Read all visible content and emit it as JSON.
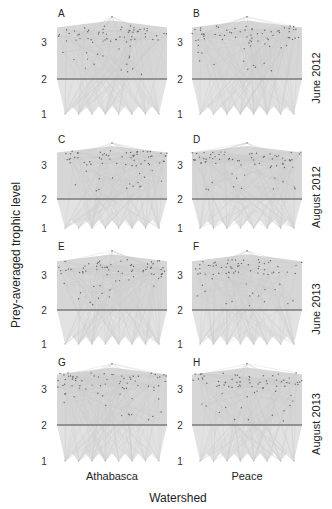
{
  "chart_data": {
    "type": "network-grid",
    "title": "",
    "xlabel": "Watershed",
    "ylabel": "Prey-averaged trophic level",
    "columns": [
      "Athabasca",
      "Peace"
    ],
    "rows": [
      "June 2012",
      "August 2012",
      "June 2013",
      "August 2013"
    ],
    "y_ticks": [
      1,
      2,
      3
    ],
    "ylim": [
      1,
      3.6
    ],
    "reference_line_at": 2,
    "panels": [
      {
        "label": "A",
        "watershed": "Athabasca",
        "period": "June 2012"
      },
      {
        "label": "B",
        "watershed": "Peace",
        "period": "June 2012"
      },
      {
        "label": "C",
        "watershed": "Athabasca",
        "period": "August 2012"
      },
      {
        "label": "D",
        "watershed": "Peace",
        "period": "August 2012"
      },
      {
        "label": "E",
        "watershed": "Athabasca",
        "period": "June 2013"
      },
      {
        "label": "F",
        "watershed": "Peace",
        "period": "June 2013"
      },
      {
        "label": "G",
        "watershed": "Athabasca",
        "period": "August 2013"
      },
      {
        "label": "H",
        "watershed": "Peace",
        "period": "August 2013"
      }
    ],
    "colors": {
      "edge": "#c8c8c8",
      "node": "#666666",
      "level2_line": "#7a7a7a"
    },
    "grid": false,
    "legend": "none"
  },
  "layout": {
    "col_x": [
      [
        57,
        167
      ],
      [
        192,
        302
      ]
    ],
    "row_ticks": [
      {
        "t3": 42,
        "t2": 79,
        "t1": 114,
        "label_y": 17
      },
      {
        "t3": 165,
        "t2": 199,
        "t1": 228,
        "label_y": 143
      },
      {
        "t3": 275,
        "t2": 310,
        "t1": 344,
        "label_y": 250
      },
      {
        "t3": 389,
        "t2": 425,
        "t1": 461,
        "label_y": 366
      }
    ]
  }
}
